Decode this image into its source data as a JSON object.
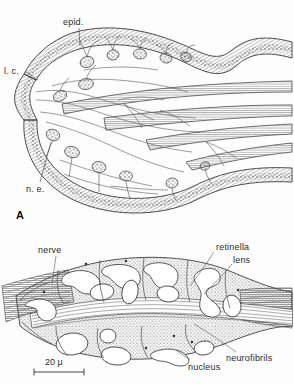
{
  "figure": {
    "background_color": "#fdfdfd",
    "ink_color": "#2b2b2b",
    "panels": [
      {
        "id": "A",
        "panel_letter": "A",
        "description": "Longitudinal section through the eye showing epidermis, lens cells, nerve endings and nerve trunks",
        "labels": [
          {
            "name": "epid",
            "text": "epid.",
            "x": 63,
            "y": 18
          },
          {
            "name": "l-c",
            "text": "l. c.",
            "x": 4,
            "y": 67
          },
          {
            "name": "n-e",
            "text": "n. e.",
            "x": 26,
            "y": 185
          }
        ]
      },
      {
        "id": "B",
        "description": "Detail of retinella cells with lenses, nuclei and neurofibrils entering from the nerve",
        "labels": [
          {
            "name": "nerve",
            "text": "nerve",
            "x": 38,
            "y": 246
          },
          {
            "name": "retinella",
            "text": "retinella",
            "x": 216,
            "y": 243
          },
          {
            "name": "lens",
            "text": "lens",
            "x": 233,
            "y": 256
          },
          {
            "name": "nucleus",
            "text": "nucleus",
            "x": 188,
            "y": 363
          },
          {
            "name": "neurofibrils",
            "text": "neurofibrils",
            "x": 226,
            "y": 354
          }
        ],
        "scale_bar": {
          "value": "20",
          "unit": "μ",
          "label": "20 μ",
          "x": 48,
          "y": 357,
          "bar_x1": 34,
          "bar_x2": 84,
          "bar_y": 372
        }
      }
    ]
  }
}
